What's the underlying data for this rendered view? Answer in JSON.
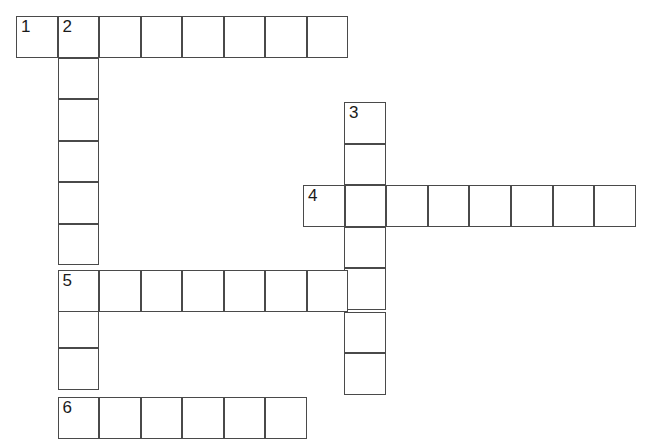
{
  "puzzle": {
    "title": "Crossword Puzzle Grid",
    "canvas": {
      "width": 648,
      "height": 448
    },
    "style": {
      "cell_size": 41.5,
      "origin_x": 16,
      "origin_y": 16,
      "line_color": "#4a4a4a",
      "cell_fill": "#ffffff",
      "number_color": "#1a1a1a",
      "background": "#ffffff"
    },
    "entries": [
      {
        "number": "1",
        "direction": "across",
        "length": 8,
        "start": {
          "col": 0,
          "row": 0
        }
      },
      {
        "number": "2",
        "direction": "down",
        "length": 10,
        "start": {
          "col": 1,
          "row": 0
        }
      },
      {
        "number": "3",
        "direction": "down",
        "length": 7,
        "start": {
          "col": 7.9,
          "row": 2.07
        }
      },
      {
        "number": "4",
        "direction": "across",
        "length": 8,
        "start": {
          "col": 6.92,
          "row": 4.09
        }
      },
      {
        "number": "5",
        "direction": "across",
        "length": 8,
        "start": {
          "col": 1,
          "row": 6.12
        }
      },
      {
        "number": "6",
        "direction": "across",
        "length": 6,
        "start": {
          "col": 1,
          "row": 9.18
        }
      }
    ],
    "cells": [
      {
        "id": "c1-0",
        "x": 16,
        "y": 16,
        "number": "1"
      },
      {
        "id": "c1-1",
        "x": 57.5,
        "y": 16,
        "number": "2"
      },
      {
        "id": "c1-2",
        "x": 99,
        "y": 16,
        "number": ""
      },
      {
        "id": "c1-3",
        "x": 140.5,
        "y": 16,
        "number": ""
      },
      {
        "id": "c1-4",
        "x": 182,
        "y": 16,
        "number": ""
      },
      {
        "id": "c1-5",
        "x": 223.5,
        "y": 16,
        "number": ""
      },
      {
        "id": "c1-6",
        "x": 265,
        "y": 16,
        "number": ""
      },
      {
        "id": "c1-7",
        "x": 306.5,
        "y": 16,
        "number": ""
      },
      {
        "id": "c2-1",
        "x": 57.5,
        "y": 57.5,
        "number": ""
      },
      {
        "id": "c2-2",
        "x": 57.5,
        "y": 99,
        "number": ""
      },
      {
        "id": "c2-3",
        "x": 57.5,
        "y": 140.5,
        "number": ""
      },
      {
        "id": "c2-4",
        "x": 57.5,
        "y": 182,
        "number": ""
      },
      {
        "id": "c2-5",
        "x": 57.5,
        "y": 223.5,
        "number": ""
      },
      {
        "id": "c2-7",
        "x": 57.5,
        "y": 306.5,
        "number": ""
      },
      {
        "id": "c2-8",
        "x": 57.5,
        "y": 348,
        "number": ""
      },
      {
        "id": "c3-0",
        "x": 344,
        "y": 102,
        "number": "3"
      },
      {
        "id": "c3-1",
        "x": 344,
        "y": 143.5,
        "number": ""
      },
      {
        "id": "c3-3",
        "x": 344,
        "y": 226.5,
        "number": ""
      },
      {
        "id": "c3-4",
        "x": 344,
        "y": 268,
        "number": ""
      },
      {
        "id": "c3-5",
        "x": 344,
        "y": 311.5,
        "number": ""
      },
      {
        "id": "c3-6",
        "x": 344,
        "y": 353,
        "number": ""
      },
      {
        "id": "c4-0",
        "x": 303,
        "y": 185,
        "number": "4"
      },
      {
        "id": "c4-1",
        "x": 344.6,
        "y": 185,
        "number": ""
      },
      {
        "id": "c4-2",
        "x": 386.2,
        "y": 185,
        "number": ""
      },
      {
        "id": "c4-3",
        "x": 427.8,
        "y": 185,
        "number": ""
      },
      {
        "id": "c4-4",
        "x": 469.4,
        "y": 185,
        "number": ""
      },
      {
        "id": "c4-5",
        "x": 511,
        "y": 185,
        "number": ""
      },
      {
        "id": "c4-6",
        "x": 552.6,
        "y": 185,
        "number": ""
      },
      {
        "id": "c4-7",
        "x": 594.2,
        "y": 185,
        "number": ""
      },
      {
        "id": "c5-0",
        "x": 57.5,
        "y": 270,
        "number": "5"
      },
      {
        "id": "c5-1",
        "x": 99,
        "y": 270,
        "number": ""
      },
      {
        "id": "c5-2",
        "x": 140.5,
        "y": 270,
        "number": ""
      },
      {
        "id": "c5-3",
        "x": 182,
        "y": 270,
        "number": ""
      },
      {
        "id": "c5-4",
        "x": 223.5,
        "y": 270,
        "number": ""
      },
      {
        "id": "c5-5",
        "x": 265,
        "y": 270,
        "number": ""
      },
      {
        "id": "c5-6",
        "x": 306.5,
        "y": 270,
        "number": ""
      },
      {
        "id": "c6-0",
        "x": 57.5,
        "y": 397,
        "number": "6"
      },
      {
        "id": "c6-1",
        "x": 99,
        "y": 397,
        "number": ""
      },
      {
        "id": "c6-2",
        "x": 140.5,
        "y": 397,
        "number": ""
      },
      {
        "id": "c6-3",
        "x": 182,
        "y": 397,
        "number": ""
      },
      {
        "id": "c6-4",
        "x": 223.5,
        "y": 397,
        "number": ""
      },
      {
        "id": "c6-5",
        "x": 265,
        "y": 397,
        "number": ""
      }
    ]
  }
}
